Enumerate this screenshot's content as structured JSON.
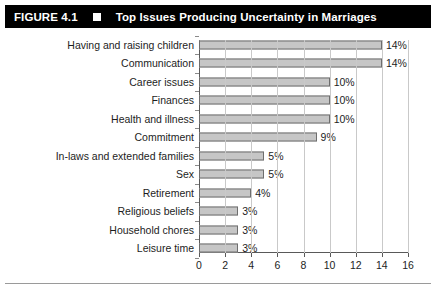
{
  "figure": {
    "number": "FIGURE 4.1",
    "marker": "black-square-marker",
    "title": "Top Issues Producing Uncertainty in Marriages"
  },
  "chart_data": {
    "type": "bar",
    "orientation": "horizontal",
    "title": "Top Issues Producing Uncertainty in Marriages",
    "xlabel": "",
    "ylabel": "",
    "xlim": [
      0,
      16
    ],
    "xticks": [
      0,
      2,
      4,
      6,
      8,
      10,
      12,
      14,
      16
    ],
    "xtick_labels": [
      "0",
      "2",
      "4",
      "6",
      "8",
      "10",
      "12",
      "14",
      "16"
    ],
    "grid": true,
    "legend": "none",
    "categories": [
      "Having and raising children",
      "Communication",
      "Career issues",
      "Finances",
      "Health and illness",
      "Commitment",
      "In-laws and extended families",
      "Sex",
      "Retirement",
      "Religious beliefs",
      "Household chores",
      "Leisure time"
    ],
    "values": [
      14,
      14,
      10,
      10,
      10,
      9,
      5,
      5,
      4,
      3,
      3,
      3
    ],
    "data_labels": [
      "14%",
      "14%",
      "10%",
      "10%",
      "10%",
      "9%",
      "5%",
      "5%",
      "4%",
      "3%",
      "3%",
      "3%"
    ],
    "colors": {
      "bar_fill": "#c6c6c6",
      "bar_border": "#6e6e6e",
      "gridline": "#c9c9c9",
      "axis": "#595959",
      "text": "#1d1d1d",
      "title_bar_bg": "#000000",
      "title_bar_text": "#ffffff"
    }
  }
}
